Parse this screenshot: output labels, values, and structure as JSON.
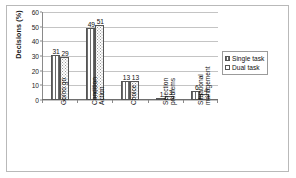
{
  "chart_data": {
    "type": "bar",
    "title": "",
    "subtitle": "",
    "xlabel": "",
    "ylabel": "Decisions (%)",
    "ylim": [
      0,
      60
    ],
    "ytick_values": [
      0,
      10,
      20,
      30,
      40,
      50,
      60
    ],
    "ytick_labels": [
      "0",
      "10",
      "20",
      "30",
      "40",
      "50",
      "60"
    ],
    "grid": "horizontal",
    "legend_position": "right",
    "categories": [
      "Go/no go",
      "Condition Action",
      "Choice",
      "Selection problems",
      "Situational management"
    ],
    "category_lines": [
      [
        "Go/no go"
      ],
      [
        "Condition",
        "Action"
      ],
      [
        "Choice"
      ],
      [
        "Selection",
        "problems"
      ],
      [
        "Situational",
        "management"
      ]
    ],
    "series": [
      {
        "name": "Single task",
        "pattern": "vertical-lines",
        "values": [
          31,
          49,
          13,
          1,
          6
        ],
        "labels": [
          "31",
          "49",
          "13",
          "1",
          "6"
        ]
      },
      {
        "name": "Dual task",
        "pattern": "dots",
        "values": [
          29,
          51,
          13,
          3,
          4
        ],
        "labels": [
          "29",
          "51",
          "13",
          "3",
          "4"
        ]
      }
    ],
    "colors": {
      "axis": "#6e6e6e",
      "grid": "#c4c4c4",
      "bar_outline": "#555555",
      "text": "#111111",
      "frame": "#b9b9b9",
      "background": "#ffffff"
    }
  },
  "legend": {
    "items": [
      {
        "label": "Single task",
        "pattern": "vertical-lines"
      },
      {
        "label": "Dual task",
        "pattern": "dots"
      }
    ]
  },
  "axes": {
    "y_title": "Decisions (%)"
  }
}
